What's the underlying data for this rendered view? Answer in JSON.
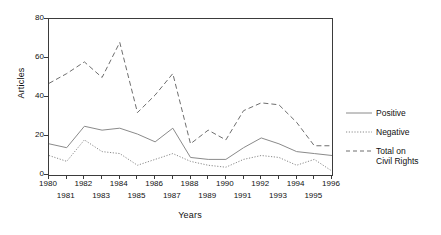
{
  "chart_data": {
    "type": "line",
    "title": "",
    "xlabel": "Years",
    "ylabel": "Articles",
    "x": [
      1980,
      1981,
      1982,
      1983,
      1984,
      1985,
      1986,
      1987,
      1988,
      1989,
      1990,
      1991,
      1992,
      1993,
      1994,
      1995,
      1996
    ],
    "xlim": [
      1980,
      1996
    ],
    "ylim": [
      0,
      80
    ],
    "yticks": [
      0,
      20,
      40,
      60,
      80
    ],
    "xticks_top_row": [
      1980,
      1982,
      1984,
      1986,
      1988,
      1990,
      1992,
      1994,
      1996
    ],
    "xticks_bottom_row": [
      1981,
      1983,
      1985,
      1987,
      1989,
      1991,
      1993,
      1995
    ],
    "grid": false,
    "legend_position": "right",
    "series": [
      {
        "name": "Positive",
        "style": "solid",
        "color": "#8a8a8a",
        "values": [
          16,
          14,
          25,
          23,
          24,
          21,
          17,
          24,
          9,
          8,
          8,
          14,
          19,
          16,
          12,
          11,
          10
        ]
      },
      {
        "name": "Negative",
        "style": "dotted",
        "color": "#8a8a8a",
        "values": [
          10,
          7,
          18,
          12,
          11,
          5,
          8,
          11,
          7,
          5,
          4,
          8,
          10,
          9,
          5,
          8,
          2
        ]
      },
      {
        "name": "Total on\nCivil Rights",
        "style": "dashed",
        "color": "#6e6e6e",
        "values": [
          47,
          52,
          58,
          50,
          68,
          32,
          41,
          52,
          16,
          23,
          18,
          33,
          37,
          36,
          27,
          15,
          15
        ]
      }
    ]
  },
  "axes": {
    "y_title": "Articles",
    "x_title": "Years",
    "y_tick_labels": [
      "80",
      "60",
      "40",
      "20",
      "0"
    ],
    "x_tick_labels_top": [
      "1980",
      "1982",
      "1984",
      "1986",
      "1988",
      "1990",
      "1992",
      "1994",
      "1996"
    ],
    "x_tick_labels_bottom": [
      "1981",
      "1983",
      "1985",
      "1987",
      "1989",
      "1991",
      "1993",
      "1995"
    ]
  },
  "legend": {
    "items": [
      {
        "label": "Positive",
        "style": "solid"
      },
      {
        "label": "Negative",
        "style": "dotted"
      },
      {
        "label": "Total on\nCivil Rights",
        "style": "dashed"
      }
    ]
  },
  "colors": {
    "axis": "#3b3b3b",
    "series_positive": "#8a8a8a",
    "series_negative": "#8a8a8a",
    "series_total": "#6e6e6e",
    "background": "#ffffff"
  }
}
